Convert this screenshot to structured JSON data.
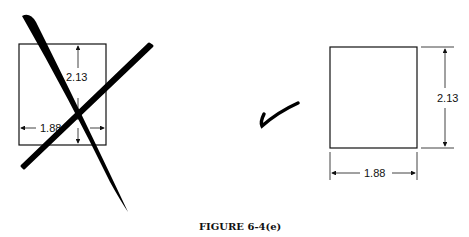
{
  "figure": {
    "caption": "FIGURE 6-4(e)",
    "wrong_example": {
      "height_label": "2.13",
      "width_label": "1.88",
      "mark": "crossed-out"
    },
    "correct_example": {
      "height_label": "2.13",
      "width_label": "1.88",
      "mark": "checkmark"
    }
  }
}
